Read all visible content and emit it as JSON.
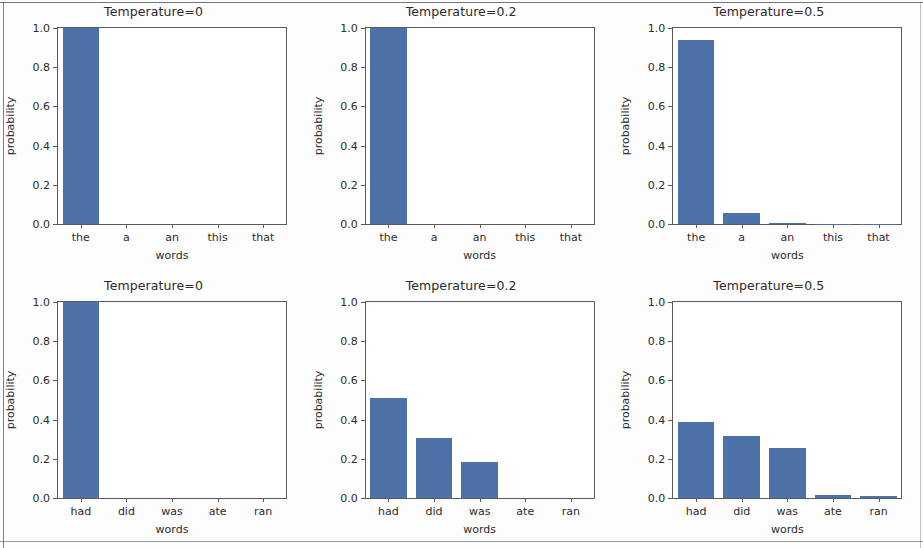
{
  "figure": {
    "width": 923,
    "height": 548,
    "background_color": "#fdfdfd",
    "bar_color": "#4c72a8",
    "axis_color": "#5a5a5a",
    "text_color": "#2b2b2b",
    "rows": 2,
    "cols": 3
  },
  "axis": {
    "ylabel": "probability",
    "xlabel": "words",
    "ytick_labels": [
      "0.0",
      "0.2",
      "0.4",
      "0.6",
      "0.8",
      "1.0"
    ],
    "ytick_values": [
      0.0,
      0.2,
      0.4,
      0.6,
      0.8,
      1.0
    ],
    "ymin": 0.0,
    "ymax": 1.0
  },
  "chart_data": [
    {
      "type": "bar",
      "title": "Temperature=0",
      "categories": [
        "the",
        "a",
        "an",
        "this",
        "that"
      ],
      "values": [
        1.0,
        0.0,
        0.0,
        0.0,
        0.0
      ],
      "xlabel": "words",
      "ylabel": "probability",
      "ylim": [
        0.0,
        1.0
      ],
      "grid": false,
      "legend": "none"
    },
    {
      "type": "bar",
      "title": "Temperature=0.2",
      "categories": [
        "the",
        "a",
        "an",
        "this",
        "that"
      ],
      "values": [
        1.0,
        0.0,
        0.0,
        0.0,
        0.0
      ],
      "xlabel": "words",
      "ylabel": "probability",
      "ylim": [
        0.0,
        1.0
      ],
      "grid": false,
      "legend": "none"
    },
    {
      "type": "bar",
      "title": "Temperature=0.5",
      "categories": [
        "the",
        "a",
        "an",
        "this",
        "that"
      ],
      "values": [
        0.94,
        0.055,
        0.003,
        0.001,
        0.001
      ],
      "xlabel": "words",
      "ylabel": "probability",
      "ylim": [
        0.0,
        1.0
      ],
      "grid": false,
      "legend": "none"
    },
    {
      "type": "bar",
      "title": "Temperature=0",
      "categories": [
        "had",
        "did",
        "was",
        "ate",
        "ran"
      ],
      "values": [
        1.0,
        0.0,
        0.0,
        0.0,
        0.0
      ],
      "xlabel": "words",
      "ylabel": "probability",
      "ylim": [
        0.0,
        1.0
      ],
      "grid": false,
      "legend": "none"
    },
    {
      "type": "bar",
      "title": "Temperature=0.2",
      "categories": [
        "had",
        "did",
        "was",
        "ate",
        "ran"
      ],
      "values": [
        0.51,
        0.305,
        0.185,
        0.0,
        0.0
      ],
      "xlabel": "words",
      "ylabel": "probability",
      "ylim": [
        0.0,
        1.0
      ],
      "grid": false,
      "legend": "none"
    },
    {
      "type": "bar",
      "title": "Temperature=0.5",
      "categories": [
        "had",
        "did",
        "was",
        "ate",
        "ran"
      ],
      "values": [
        0.39,
        0.315,
        0.255,
        0.015,
        0.01
      ],
      "xlabel": "words",
      "ylabel": "probability",
      "ylim": [
        0.0,
        1.0
      ],
      "grid": false,
      "legend": "none"
    }
  ]
}
